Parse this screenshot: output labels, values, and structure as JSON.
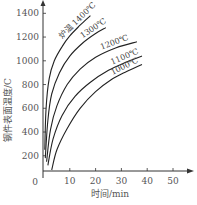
{
  "chart_data": {
    "type": "line",
    "title": "",
    "xlabel": "时间/min",
    "ylabel": "钢件表面温度/C",
    "xlim": [
      0,
      55
    ],
    "ylim": [
      0,
      1450
    ],
    "x_ticks": [
      "0",
      "10",
      "20",
      "30",
      "40",
      "50"
    ],
    "y_ticks": [
      "200",
      "400",
      "600",
      "800",
      "1000",
      "1200",
      "1400"
    ],
    "grid": false,
    "legend": "inline labels on curves",
    "series": [
      {
        "name": "炉温 1400℃",
        "label": "炉温 1400℃",
        "points": [
          [
            0.3,
            250
          ],
          [
            0.8,
            600
          ],
          [
            2,
            850
          ],
          [
            4,
            1000
          ],
          [
            7,
            1120
          ],
          [
            10,
            1210
          ],
          [
            14,
            1300
          ],
          [
            18,
            1380
          ]
        ]
      },
      {
        "name": "1300℃",
        "label": "1300℃",
        "points": [
          [
            0.5,
            180
          ],
          [
            1.5,
            500
          ],
          [
            3,
            720
          ],
          [
            6,
            900
          ],
          [
            10,
            1040
          ],
          [
            15,
            1150
          ],
          [
            20,
            1230
          ],
          [
            24,
            1280
          ]
        ]
      },
      {
        "name": "1200℃",
        "label": "1200℃",
        "points": [
          [
            1,
            150
          ],
          [
            2.5,
            420
          ],
          [
            5,
            620
          ],
          [
            9,
            800
          ],
          [
            14,
            930
          ],
          [
            20,
            1030
          ],
          [
            28,
            1110
          ],
          [
            36,
            1160
          ]
        ]
      },
      {
        "name": "1100℃",
        "label": "1100℃",
        "points": [
          [
            1.5,
            120
          ],
          [
            3.5,
            340
          ],
          [
            7,
            540
          ],
          [
            12,
            700
          ],
          [
            18,
            820
          ],
          [
            25,
            920
          ],
          [
            32,
            990
          ],
          [
            38,
            1040
          ]
        ]
      },
      {
        "name": "1000℃",
        "label": "1000℃",
        "points": [
          [
            3,
            80
          ],
          [
            5,
            250
          ],
          [
            9,
            430
          ],
          [
            14,
            600
          ],
          [
            20,
            740
          ],
          [
            26,
            840
          ],
          [
            32,
            910
          ],
          [
            38,
            970
          ]
        ]
      }
    ]
  },
  "axes": {
    "x_title": "时间/min",
    "y_title": "钢件表面温度/C",
    "origin_label": "0"
  }
}
